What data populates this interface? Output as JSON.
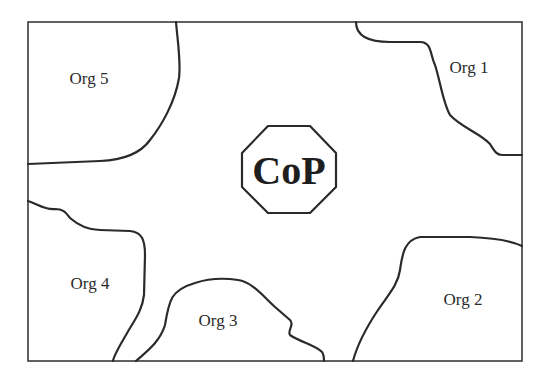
{
  "diagram": {
    "center": {
      "label": "CoP",
      "shape": "octagon"
    },
    "regions": [
      {
        "id": "org1",
        "label": "Org 1",
        "position": "top-right"
      },
      {
        "id": "org2",
        "label": "Org 2",
        "position": "bottom-right"
      },
      {
        "id": "org3",
        "label": "Org 3",
        "position": "bottom-center"
      },
      {
        "id": "org4",
        "label": "Org 4",
        "position": "bottom-left"
      },
      {
        "id": "org5",
        "label": "Org 5",
        "position": "top-left"
      }
    ]
  }
}
